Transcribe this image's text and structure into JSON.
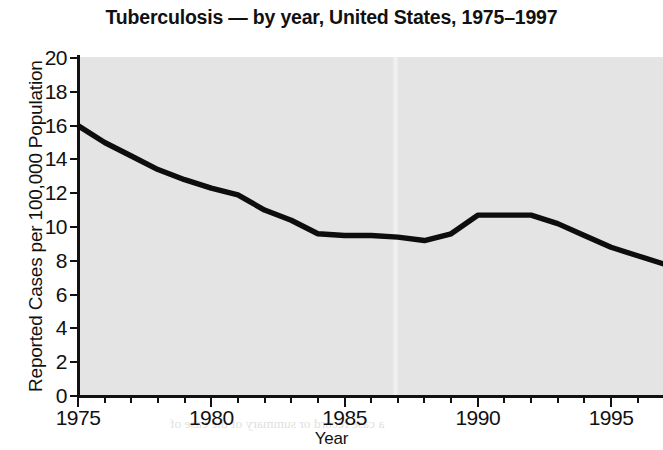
{
  "chart_data": {
    "type": "line",
    "title": "Tuberculosis — by year, United States, 1975–1997",
    "xlabel": "Year",
    "ylabel": "Reported Cases per 100,000 Population",
    "xlim": [
      1975,
      1997
    ],
    "ylim": [
      0,
      20
    ],
    "ytick_step": 2,
    "xtick_step": 5,
    "grid": false,
    "legend": null,
    "line_color": "#0d0d0d",
    "plot_background": "#e4e4e4",
    "page_background": "#ffffff",
    "ytick_labels": [
      "20",
      "18",
      "16",
      "14",
      "12",
      "10",
      "8",
      "6",
      "4",
      "2",
      "0"
    ],
    "ytick_values": [
      20,
      18,
      16,
      14,
      12,
      10,
      8,
      6,
      4,
      2,
      0
    ],
    "xtick_labels": [
      "1975",
      "1980",
      "1985",
      "1990",
      "1995"
    ],
    "xtick_values": [
      1975,
      1980,
      1985,
      1990,
      1995
    ],
    "xtick_minor_values": [
      1976,
      1977,
      1978,
      1979,
      1981,
      1982,
      1983,
      1984,
      1986,
      1987,
      1988,
      1989,
      1991,
      1992,
      1993,
      1994,
      1996,
      1997
    ],
    "x": [
      1975,
      1976,
      1977,
      1978,
      1979,
      1980,
      1981,
      1982,
      1983,
      1984,
      1985,
      1986,
      1987,
      1988,
      1989,
      1990,
      1991,
      1992,
      1993,
      1994,
      1995,
      1996,
      1997
    ],
    "values": [
      16.0,
      15.0,
      14.2,
      13.4,
      12.8,
      12.3,
      11.9,
      11.0,
      10.4,
      9.6,
      9.5,
      9.5,
      9.4,
      9.2,
      9.6,
      10.7,
      10.7,
      10.7,
      10.2,
      9.5,
      8.8,
      8.3,
      7.8
    ],
    "series": [
      {
        "name": "Reported TB cases per 100,000 population",
        "values": [
          16.0,
          15.0,
          14.2,
          13.4,
          12.8,
          12.3,
          11.9,
          11.0,
          10.4,
          9.6,
          9.5,
          9.5,
          9.4,
          9.2,
          9.6,
          10.7,
          10.7,
          10.7,
          10.2,
          9.5,
          8.8,
          8.3,
          7.8
        ]
      }
    ]
  },
  "background_text": {
    "lines": [
      "rnal as evidence and a copy of a second",
      "to the court. The patient waits and can",
      "a case record or summary of the case of",
      "the case before the meeting of the court",
      "be sent the person named. Such evidence is",
      "of this type of record is the responsibility",
      "the patient, and where required to be filed",
      "included with documentation in the court's",
      "documented and complete with any other",
      "may be requested in the form of a written",
      "a case record for the court and to the patient"
    ]
  }
}
